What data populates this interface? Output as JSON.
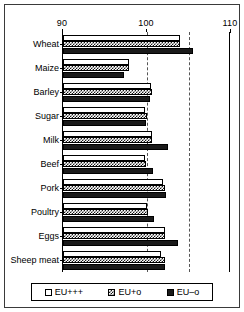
{
  "chart_data": {
    "type": "bar",
    "orientation": "horizontal",
    "title": "",
    "xlabel": "",
    "ylabel": "",
    "xlim": [
      90,
      110
    ],
    "xticks": [
      90,
      100,
      110
    ],
    "xtick_labels": [
      "90",
      "100",
      "110"
    ],
    "gridlines": [
      100,
      105
    ],
    "grid": true,
    "axis_position": "top",
    "legend_position": "bottom",
    "categories": [
      "Wheat",
      "Maize",
      "Barley",
      "Sugar",
      "Milk",
      "Beef",
      "Pork",
      "Poultry",
      "Eggs",
      "Sheep meat"
    ],
    "series": [
      {
        "name": "EU+++",
        "fill": "white",
        "values": [
          103.9,
          97.8,
          100.5,
          99.8,
          100.6,
          99.8,
          101.9,
          100.0,
          102.1,
          101.7
        ]
      },
      {
        "name": "EU+o",
        "fill": "hatched",
        "values": [
          103.9,
          97.9,
          100.6,
          100.0,
          100.6,
          99.9,
          102.2,
          100.1,
          102.2,
          102.1
        ]
      },
      {
        "name": "EU–o",
        "fill": "black",
        "values": [
          105.5,
          97.3,
          100.3,
          99.9,
          102.5,
          100.7,
          102.3,
          100.8,
          103.7,
          102.2
        ]
      }
    ]
  },
  "legend": {
    "items": [
      {
        "label": "EU+++",
        "swatch": "white-square-icon"
      },
      {
        "label": "EU+o",
        "swatch": "hatched-square-icon"
      },
      {
        "label": "EU–o",
        "swatch": "black-square-icon"
      }
    ]
  }
}
